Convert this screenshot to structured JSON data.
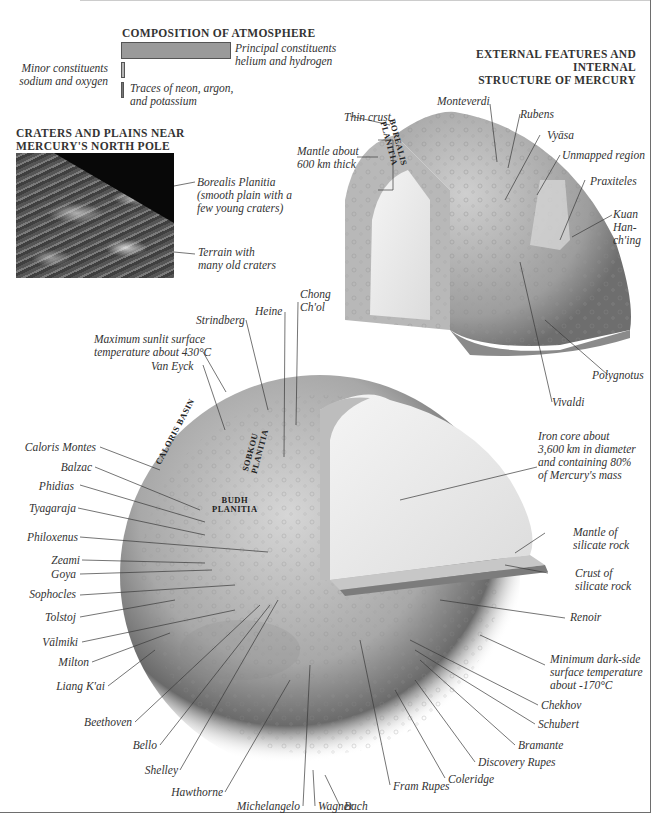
{
  "atmosphere": {
    "title": "COMPOSITION OF ATMOSPHERE",
    "principal": "Principal constituents\nhelium and hydrogen",
    "minor": "Minor constituents\nsodium and oxygen",
    "traces": "Traces of  neon, argon,\nand potassium",
    "bar_colors": {
      "principal": "#9a9a9a",
      "minor": "#b5b5b5",
      "traces": "#777777"
    }
  },
  "structure_title": "EXTERNAL FEATURES AND INTERNAL\nSTRUCTURE OF MERCURY",
  "photo": {
    "title": "CRATERS AND PLAINS NEAR\nMERCURY'S NORTH POLE",
    "label_borealis": "Borealis Planitia\n(smooth plain with a\nfew young craters)",
    "label_terrain": "Terrain with\nmany old craters"
  },
  "small_globe": {
    "overlay": "BOREALIS\nPLANITIA",
    "labels": {
      "thin_crust": "Thin crust",
      "mantle": "Mantle about\n600 km thick",
      "monteverdi": "Monteverdi",
      "rubens": "Rubens",
      "vyasa": "Vyāsa",
      "unmapped": "Unmapped region",
      "praxiteles": "Praxiteles",
      "kuan": "Kuan\nHan-\nch'ing",
      "polygnotus": "Polygnotus",
      "vivaldi": "Vivaldi"
    }
  },
  "big_globe": {
    "overlays": {
      "caloris": "CALORIS BASIN",
      "sobkou": "SOBKOU\nPLANITIA",
      "budh": "BUDH\nPLANITIA"
    },
    "labels": {
      "max_temp": "Maximum sunlit surface\ntemperature about 430°C",
      "strindberg": "Strindberg",
      "heine": "Heine",
      "chong": "Chong\nCh'ol",
      "van_eyck": "Van Eyck",
      "caloris_montes": "Caloris Montes",
      "balzac": "Balzac",
      "phidias": "Phidias",
      "tyagaraja": "Tyagaraja",
      "philoxenus": "Philoxenus",
      "zeami": "Zeami",
      "goya": "Goya",
      "sophocles": "Sophocles",
      "tolstoj": "Tolstoj",
      "valmiki": "Vālmiki",
      "milton": "Milton",
      "liang": "Liang K'ai",
      "beethoven": "Beethoven",
      "bello": "Bello",
      "shelley": "Shelley",
      "hawthorne": "Hawthorne",
      "michelangelo": "Michelangelo",
      "wagner": "Wagner",
      "bach": "Bach",
      "fram": "Fram Rupes",
      "coleridge": "Coleridge",
      "discovery": "Discovery Rupes",
      "bramante": "Bramante",
      "schubert": "Schubert",
      "chekhov": "Chekhov",
      "min_temp": "Minimum dark-side\nsurface temperature\nabout -170°C",
      "renoir": "Renoir",
      "crust": "Crust of\nsilicate rock",
      "mantle": "Mantle of\nsilicate rock",
      "core": "Iron core about\n3,600 km in diameter\nand containing 80%\nof  Mercury's mass"
    }
  }
}
